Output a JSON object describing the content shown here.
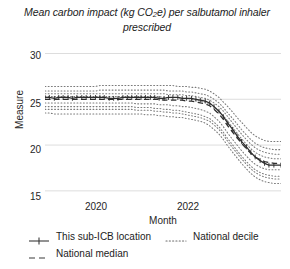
{
  "chart_data": {
    "type": "line",
    "title": "Mean carbon impact (kg CO2e) per salbutamol inhaler prescribed",
    "title_prefix": "Mean carbon impact (kg CO",
    "title_sub": "2",
    "title_suffix": "e) per salbutamol inhaler prescribed",
    "xlabel": "Month",
    "ylabel": "Measure",
    "ylim": [
      14.0,
      30.6
    ],
    "yticks": [
      15,
      20,
      25,
      30
    ],
    "ytick_labels": [
      "15",
      "20",
      "25",
      "30"
    ],
    "xlim": [
      2019.0,
      2023.3
    ],
    "xticks": [
      2020,
      2022
    ],
    "xtick_labels": [
      "2020",
      "2022"
    ],
    "grid": "horizontal",
    "grid_color": "#d9d9d9",
    "legend_position": "below",
    "line_color": "#3a3a3a",
    "x": [
      2019.0,
      2019.08,
      2019.17,
      2019.25,
      2019.33,
      2019.42,
      2019.5,
      2019.58,
      2019.67,
      2019.75,
      2019.83,
      2019.92,
      2020.0,
      2020.08,
      2020.17,
      2020.25,
      2020.33,
      2020.42,
      2020.5,
      2020.58,
      2020.67,
      2020.75,
      2020.83,
      2020.92,
      2021.0,
      2021.08,
      2021.17,
      2021.25,
      2021.33,
      2021.42,
      2021.5,
      2021.58,
      2021.67,
      2021.75,
      2021.83,
      2021.92,
      2022.0,
      2022.08,
      2022.17,
      2022.25,
      2022.33,
      2022.42,
      2022.5,
      2022.58,
      2022.67,
      2022.75,
      2022.83,
      2022.92,
      2023.0,
      2023.08,
      2023.17,
      2023.3
    ],
    "series": [
      {
        "name": "This sub-ICB location",
        "style": "solid-marker",
        "values": [
          25.2,
          25.2,
          25.1,
          25.2,
          25.2,
          25.2,
          25.1,
          25.2,
          25.2,
          25.2,
          25.2,
          25.2,
          25.2,
          25.2,
          25.1,
          25.1,
          25.1,
          25.2,
          25.2,
          25.2,
          25.2,
          25.2,
          25.2,
          25.2,
          25.2,
          25.1,
          25.1,
          25.2,
          25.2,
          25.2,
          25.1,
          25.1,
          25.1,
          25.0,
          24.9,
          24.8,
          24.6,
          24.2,
          23.7,
          23.1,
          22.4,
          21.7,
          21.0,
          20.4,
          19.8,
          19.2,
          18.7,
          18.3,
          18.0,
          17.8,
          17.8,
          17.8
        ]
      },
      {
        "name": "National median",
        "style": "dashed",
        "values": [
          25.0,
          25.0,
          25.0,
          25.0,
          25.0,
          25.0,
          25.0,
          25.0,
          25.0,
          25.0,
          25.0,
          25.0,
          25.0,
          25.0,
          25.0,
          25.0,
          25.0,
          25.0,
          25.0,
          25.0,
          25.0,
          25.0,
          25.0,
          25.0,
          25.0,
          25.0,
          24.9,
          24.9,
          24.9,
          24.9,
          24.9,
          24.8,
          24.8,
          24.7,
          24.6,
          24.5,
          24.3,
          23.9,
          23.4,
          22.8,
          22.1,
          21.4,
          20.8,
          20.2,
          19.6,
          19.1,
          18.7,
          18.4,
          18.2,
          18.1,
          18.0,
          18.0
        ]
      },
      {
        "name": "National decile",
        "style": "dotted",
        "deciles": [
          {
            "decile": 10,
            "values": [
              23.5,
              23.5,
              23.4,
              23.4,
              23.4,
              23.4,
              23.4,
              23.4,
              23.4,
              23.4,
              23.4,
              23.4,
              23.4,
              23.4,
              23.4,
              23.4,
              23.4,
              23.4,
              23.4,
              23.4,
              23.4,
              23.4,
              23.3,
              23.3,
              23.3,
              23.2,
              23.2,
              23.1,
              23.1,
              23.0,
              23.0,
              22.9,
              22.8,
              22.7,
              22.6,
              22.4,
              22.1,
              21.7,
              21.2,
              20.6,
              19.9,
              19.2,
              18.6,
              18.0,
              17.4,
              16.9,
              16.5,
              16.2,
              16.0,
              15.9,
              15.8,
              15.8
            ]
          },
          {
            "decile": 20,
            "values": [
              23.9,
              23.9,
              23.9,
              23.9,
              23.9,
              23.9,
              23.9,
              23.9,
              23.9,
              23.9,
              23.9,
              23.9,
              23.9,
              23.9,
              23.9,
              23.9,
              23.9,
              23.9,
              23.9,
              23.9,
              23.8,
              23.8,
              23.8,
              23.8,
              23.7,
              23.7,
              23.6,
              23.6,
              23.5,
              23.5,
              23.4,
              23.3,
              23.2,
              23.1,
              23.0,
              22.8,
              22.6,
              22.2,
              21.7,
              21.1,
              20.4,
              19.7,
              19.1,
              18.5,
              17.9,
              17.4,
              17.0,
              16.7,
              16.5,
              16.4,
              16.3,
              16.3
            ]
          },
          {
            "decile": 30,
            "values": [
              24.2,
              24.2,
              24.2,
              24.2,
              24.2,
              24.2,
              24.2,
              24.2,
              24.2,
              24.2,
              24.2,
              24.2,
              24.2,
              24.2,
              24.2,
              24.2,
              24.2,
              24.2,
              24.2,
              24.2,
              24.1,
              24.1,
              24.1,
              24.1,
              24.0,
              24.0,
              23.9,
              23.9,
              23.8,
              23.8,
              23.7,
              23.6,
              23.5,
              23.4,
              23.3,
              23.1,
              22.9,
              22.5,
              22.0,
              21.4,
              20.7,
              20.0,
              19.4,
              18.8,
              18.2,
              17.7,
              17.3,
              17.0,
              16.8,
              16.7,
              16.6,
              16.6
            ]
          },
          {
            "decile": 40,
            "values": [
              24.6,
              24.6,
              24.6,
              24.6,
              24.6,
              24.6,
              24.6,
              24.6,
              24.6,
              24.6,
              24.6,
              24.6,
              24.6,
              24.6,
              24.6,
              24.6,
              24.6,
              24.6,
              24.6,
              24.6,
              24.5,
              24.5,
              24.5,
              24.5,
              24.5,
              24.4,
              24.4,
              24.4,
              24.3,
              24.3,
              24.2,
              24.2,
              24.1,
              24.0,
              23.9,
              23.7,
              23.5,
              23.1,
              22.6,
              22.0,
              21.3,
              20.6,
              20.0,
              19.4,
              18.8,
              18.3,
              17.9,
              17.6,
              17.4,
              17.3,
              17.3,
              17.3
            ]
          },
          {
            "decile": 60,
            "values": [
              25.3,
              25.3,
              25.3,
              25.3,
              25.3,
              25.3,
              25.3,
              25.3,
              25.3,
              25.3,
              25.3,
              25.3,
              25.3,
              25.3,
              25.3,
              25.3,
              25.3,
              25.3,
              25.3,
              25.3,
              25.3,
              25.3,
              25.3,
              25.3,
              25.3,
              25.3,
              25.2,
              25.2,
              25.2,
              25.2,
              25.1,
              25.1,
              25.0,
              24.9,
              24.8,
              24.7,
              24.5,
              24.2,
              23.7,
              23.2,
              22.6,
              21.9,
              21.3,
              20.7,
              20.1,
              19.6,
              19.2,
              18.9,
              18.7,
              18.6,
              18.5,
              18.5
            ]
          },
          {
            "decile": 70,
            "values": [
              25.6,
              25.6,
              25.6,
              25.6,
              25.6,
              25.6,
              25.6,
              25.6,
              25.6,
              25.6,
              25.6,
              25.6,
              25.6,
              25.6,
              25.6,
              25.6,
              25.6,
              25.6,
              25.6,
              25.6,
              25.6,
              25.6,
              25.6,
              25.6,
              25.6,
              25.6,
              25.6,
              25.5,
              25.5,
              25.5,
              25.5,
              25.4,
              25.4,
              25.3,
              25.2,
              25.1,
              24.9,
              24.6,
              24.2,
              23.7,
              23.1,
              22.4,
              21.8,
              21.2,
              20.6,
              20.1,
              19.7,
              19.4,
              19.2,
              19.1,
              19.0,
              19.0
            ]
          },
          {
            "decile": 80,
            "values": [
              25.9,
              25.9,
              25.9,
              25.9,
              25.9,
              25.9,
              25.9,
              25.9,
              25.9,
              25.9,
              25.9,
              25.9,
              26.0,
              26.0,
              26.0,
              26.0,
              26.0,
              26.0,
              26.0,
              26.0,
              26.0,
              26.0,
              26.0,
              26.0,
              26.0,
              26.0,
              26.0,
              25.9,
              25.9,
              25.9,
              25.9,
              25.8,
              25.8,
              25.7,
              25.6,
              25.5,
              25.3,
              25.0,
              24.6,
              24.1,
              23.5,
              22.9,
              22.3,
              21.7,
              21.1,
              20.6,
              20.2,
              19.9,
              19.7,
              19.6,
              19.5,
              19.5
            ]
          },
          {
            "decile": 90,
            "values": [
              26.4,
              26.4,
              26.4,
              26.4,
              26.4,
              26.4,
              26.4,
              26.4,
              26.4,
              26.4,
              26.4,
              26.4,
              26.5,
              26.5,
              26.5,
              26.5,
              26.5,
              26.5,
              26.5,
              26.5,
              26.5,
              26.5,
              26.5,
              26.5,
              26.5,
              26.5,
              26.5,
              26.5,
              26.5,
              26.4,
              26.4,
              26.4,
              26.3,
              26.3,
              26.2,
              26.1,
              25.9,
              25.6,
              25.2,
              24.7,
              24.2,
              23.6,
              23.0,
              22.5,
              21.9,
              21.4,
              21.0,
              20.7,
              20.5,
              20.4,
              20.4,
              20.4
            ]
          }
        ]
      }
    ],
    "legend": [
      {
        "label": "This sub-ICB location",
        "style": "solid-marker"
      },
      {
        "label": "National decile",
        "style": "dotted"
      },
      {
        "label": "National median",
        "style": "dashed"
      }
    ]
  }
}
